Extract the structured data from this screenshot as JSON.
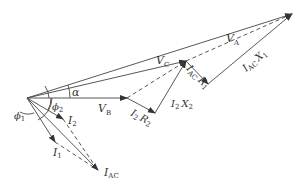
{
  "diagram": {
    "type": "phasor-diagram",
    "labels": {
      "VA": {
        "main": "V",
        "sub": "A"
      },
      "VC": {
        "main": "V",
        "sub": "C"
      },
      "VB": {
        "main": "V",
        "sub": "B"
      },
      "alpha": "α",
      "phi1": {
        "main": "ϕ",
        "sub": "1"
      },
      "phi2": {
        "main": "ϕ",
        "sub": "2"
      },
      "I1": {
        "main": "I",
        "sub": "1"
      },
      "I2": {
        "main": "I",
        "sub": "2"
      },
      "IAC": {
        "main": "I",
        "sub": "AC"
      },
      "I2R2": {
        "a": "I",
        "asub": "2",
        "b": "R",
        "bsub": "2"
      },
      "I2X2": {
        "a": "I",
        "asub": "2",
        "b": "X",
        "bsub": "2"
      },
      "IACR1": {
        "a": "I",
        "asub": "AC",
        "b": "R",
        "bsub": "1"
      },
      "IACX1": {
        "a": "I",
        "asub": "AC",
        "b": "X",
        "bsub": "1"
      }
    },
    "points": {
      "O": [
        27,
        98
      ],
      "VB": [
        127,
        98
      ],
      "I2R2": [
        155,
        113
      ],
      "VC": [
        186,
        61
      ],
      "IACR1": [
        208,
        84
      ],
      "VA": [
        292,
        14
      ],
      "I2": [
        63,
        119
      ],
      "I1": [
        55,
        142
      ],
      "IAC": [
        98,
        170
      ]
    },
    "colors": {
      "line": "#444444",
      "text": "#333333"
    }
  }
}
